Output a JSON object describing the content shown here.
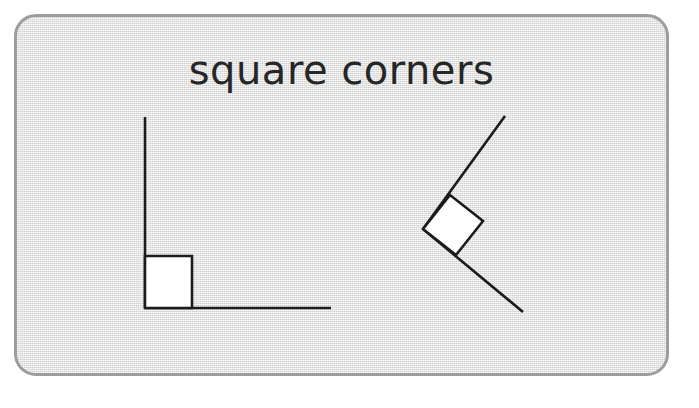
{
  "page": {
    "background_color": "#ffffff",
    "width": 699,
    "height": 408
  },
  "card": {
    "name": "slide-card",
    "fill_color": "#e4e4e4",
    "border_color": "#9d9d9d",
    "border_radius": 22,
    "x": 14,
    "y": 14,
    "width": 655,
    "height": 362
  },
  "title": {
    "text": "square corners",
    "color": "#262626",
    "font_size": 40
  },
  "figures": {
    "stroke_color": "#1b1b1b",
    "marker_fill": "#ffffff",
    "stroke_width": 2.6,
    "items": [
      {
        "name": "right-angle-upright",
        "label": "upright right angle",
        "vertex": [
          159,
          322
        ],
        "rays": [
          {
            "name": "vertical-ray",
            "from": [
              159,
              322
            ],
            "to": [
              159,
              131
            ]
          },
          {
            "name": "horizontal-ray",
            "from": [
              159,
              322
            ],
            "to": [
              345,
              322
            ]
          }
        ],
        "square_marker": {
          "name": "right-angle-square-marker",
          "points": "159,270 206,270 206,322 159,322"
        }
      },
      {
        "name": "right-angle-rotated",
        "label": "rotated right angle",
        "vertex": [
          437,
          243
        ],
        "rays": [
          {
            "name": "upper-ray",
            "from": [
              437,
              243
            ],
            "to": [
              519,
              130
            ]
          },
          {
            "name": "lower-ray",
            "from": [
              437,
              243
            ],
            "to": [
              537,
              326
            ]
          }
        ],
        "square_marker": {
          "name": "right-angle-square-marker",
          "points": "437,243 464,209 497,235 470,269"
        }
      }
    ]
  }
}
